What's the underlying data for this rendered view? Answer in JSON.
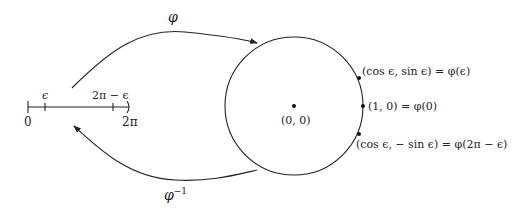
{
  "diagram": {
    "interval": {
      "left_label": "0",
      "right_label": "2π",
      "tick_eps_label": "ϵ",
      "tick_2pi_minus_eps_label": "2π − ϵ",
      "right_end_open": true
    },
    "arrows": {
      "forward_label": "φ",
      "inverse_label": "φ",
      "inverse_superscript": "−1"
    },
    "circle": {
      "center_label": "(0, 0)",
      "points": [
        {
          "name": "point-phi-eps",
          "label": "(cos ϵ, sin ϵ) = φ(ϵ)"
        },
        {
          "name": "point-phi-0",
          "label": "(1, 0) = φ(0)"
        },
        {
          "name": "point-phi-2pi-minus-eps",
          "label": "(cos ϵ, − sin ϵ) = φ(2π − ϵ)"
        }
      ]
    }
  }
}
